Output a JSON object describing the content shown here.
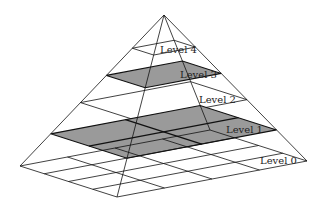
{
  "colors": {
    "shaded": "#9a9a9a",
    "line": "#111111",
    "background": "#ffffff"
  },
  "geometry": {
    "apex": [
      164,
      15
    ],
    "base": {
      "left": [
        20,
        166
      ],
      "front": [
        117,
        197
      ],
      "right": [
        307,
        161
      ],
      "back": [
        210,
        130
      ]
    }
  },
  "levels": [
    {
      "name": "Level 4",
      "label": "Level 4",
      "t": 0.22,
      "grid": 1,
      "shaded": false,
      "label_pos": [
        160,
        53
      ]
    },
    {
      "name": "Level 3",
      "label": "Level 3",
      "t": 0.4,
      "grid": 1,
      "shaded": true,
      "label_pos": [
        180,
        78
      ]
    },
    {
      "name": "Level 2",
      "label": "Level 2",
      "t": 0.58,
      "grid": 1,
      "shaded": false,
      "label_pos": [
        199,
        103
      ]
    },
    {
      "name": "Level 1",
      "label": "Level 1",
      "t": 0.787,
      "grid": 2,
      "shaded": true,
      "label_pos": [
        226,
        133
      ]
    },
    {
      "name": "Level 0",
      "label": "Level 0",
      "t": 1.0,
      "grid": 4,
      "shaded": false,
      "label_pos": [
        260,
        164
      ]
    }
  ]
}
